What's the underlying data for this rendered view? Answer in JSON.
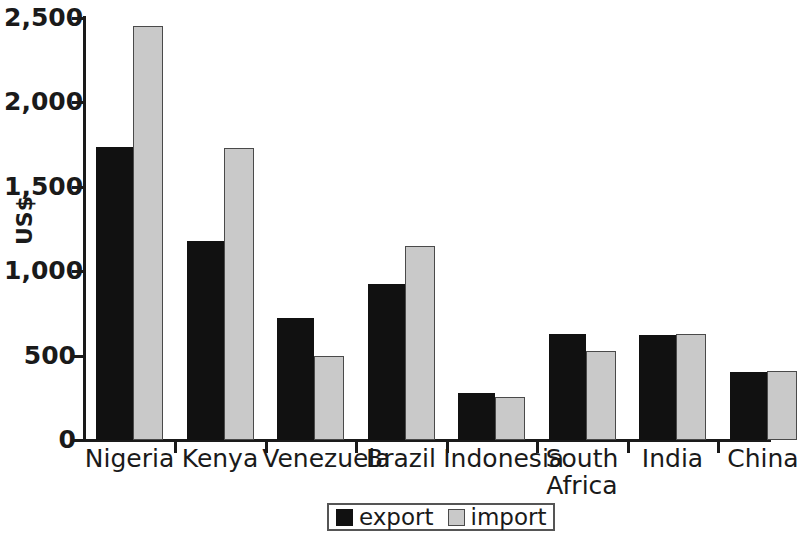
{
  "chart_data": {
    "type": "bar",
    "title": "",
    "subtitle": "",
    "xlabel": "",
    "ylabel": "US$",
    "ylim": [
      0,
      2500
    ],
    "yticks": [
      0,
      500,
      1000,
      1500,
      2000,
      2500
    ],
    "ytick_labels": [
      "0",
      "500",
      "1,000",
      "1,500",
      "2,000",
      "2,500"
    ],
    "grid": false,
    "legend_position": "bottom-center",
    "categories": [
      "Nigeria",
      "Kenya",
      "Venezuela",
      "Brazil",
      "Indonesia",
      "South\nAfrica",
      "India",
      "China"
    ],
    "series": [
      {
        "name": "export",
        "color": "#111111",
        "values": [
          1735,
          1180,
          725,
          925,
          280,
          630,
          620,
          400
        ]
      },
      {
        "name": "import",
        "color": "#c9c9c9",
        "values": [
          2450,
          1730,
          495,
          1150,
          255,
          530,
          630,
          410
        ]
      }
    ]
  },
  "legend": {
    "entries": [
      {
        "label": "export",
        "swatch": "black-square-icon"
      },
      {
        "label": "import",
        "swatch": "gray-square-icon"
      }
    ]
  }
}
